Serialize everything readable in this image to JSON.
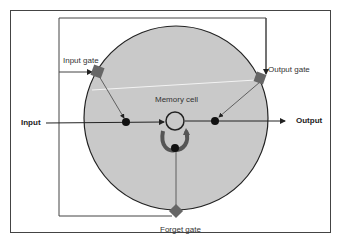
{
  "diagram": {
    "type": "LSTM memory cell",
    "labels": {
      "input": "Input",
      "output": "Output",
      "input_gate": "Input gate",
      "output_gate": "Output gate",
      "forget_gate": "Forget gate",
      "memory_cell": "Memory cell"
    },
    "colors": {
      "circle_fill": "#c9c9c9",
      "gate_fill": "#666666",
      "line": "#333333",
      "background": "#ffffff"
    }
  }
}
